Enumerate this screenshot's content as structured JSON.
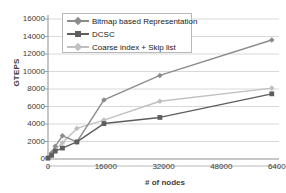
{
  "chart_data": {
    "type": "line",
    "title": "",
    "xlabel": "# of nodes",
    "ylabel": "GTEPS",
    "xlim": [
      0,
      64000
    ],
    "ylim": [
      0,
      16000
    ],
    "xticks": [
      0,
      16000,
      32000,
      48000,
      64000
    ],
    "yticks": [
      0,
      2000,
      4000,
      6000,
      8000,
      10000,
      12000,
      14000,
      16000
    ],
    "xtick_labels": [
      "0",
      "16000",
      "32000",
      "48000",
      "64000"
    ],
    "ytick_labels": [
      "0",
      "2000",
      "4000",
      "6000",
      "8000",
      "10000",
      "12000",
      "14000",
      "16000"
    ],
    "grid": "horizontal",
    "legend_position": "top-left-inside",
    "x": [
      0,
      1000,
      2000,
      4000,
      8000,
      15500,
      31000,
      62000
    ],
    "series": [
      {
        "name": "Bitmap based Representation",
        "color": "#8c8c8c",
        "marker": "diamond",
        "values": [
          150,
          700,
          1450,
          2650,
          1950,
          6750,
          9550,
          13600
        ]
      },
      {
        "name": "DCSC",
        "color": "#5e5e5e",
        "marker": "square",
        "values": [
          100,
          420,
          900,
          1250,
          1950,
          4050,
          4750,
          7450
        ]
      },
      {
        "name": "Coarse index + Skip list",
        "color": "#c0c0c0",
        "marker": "diamond",
        "values": [
          120,
          480,
          1050,
          1850,
          3500,
          4450,
          6600,
          8100
        ]
      }
    ]
  },
  "axes": {
    "ylabel": "GTEPS",
    "xlabel": "# of nodes"
  },
  "legend": {
    "items": [
      {
        "label": "Bitmap based Representation",
        "color": "#8c8c8c",
        "marker": "diamond"
      },
      {
        "label": "DCSC",
        "color": "#5e5e5e",
        "marker": "square"
      },
      {
        "label": "Coarse index + Skip list",
        "color": "#c0c0c0",
        "marker": "diamond"
      }
    ]
  }
}
